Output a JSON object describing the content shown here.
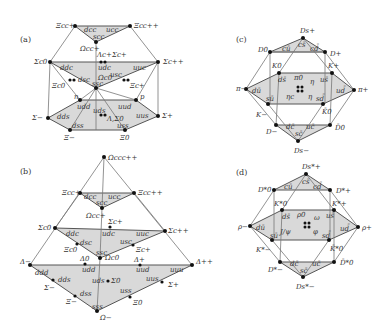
{
  "panels": {
    "a": {
      "label": "(a)",
      "top": {
        "left": "Ξcc+",
        "right": "Ξcc++",
        "q1": "dcc",
        "q2": "ucc",
        "q3": "scc",
        "center": "Ωcc+"
      },
      "middle": {
        "left": "Σc0",
        "right": "Σc++",
        "q_ddc": "ddc",
        "q_udc": "udc",
        "q_uuc": "uuc",
        "q_dsc": "dsc",
        "q_usc": "usc",
        "q_ssc": "ssc",
        "lam": "Λc+",
        "sig": "Σc+",
        "xi0": "Ξc0",
        "xiP": "Ξc+",
        "omega": "Ωc0"
      },
      "bottom": {
        "n": "n",
        "p": "p",
        "sm": "Σ−",
        "sp": "Σ+",
        "xm": "Ξ−",
        "x0": "Ξ0",
        "q_udd": "udd",
        "q_uud": "uud",
        "q_dds": "dds",
        "q_uds": "uds",
        "q_uus": "uus",
        "q_dss": "dss",
        "q_uss": "uss",
        "ls": "Λ,Σ0"
      }
    },
    "b": {
      "label": "(b)",
      "apex": "Ωccc++",
      "top": {
        "left": "Ξcc+",
        "right": "Ξcc++",
        "q1": "dcc",
        "q2": "ucc",
        "q3": "scc",
        "center": "Ωcc+"
      },
      "middle": {
        "left": "Σc0",
        "right": "Σc++",
        "sig": "Σc+",
        "q_ddc": "ddc",
        "q_udc": "udc",
        "q_uuc": "uuc",
        "q_dsc": "dsc",
        "q_usc": "usc",
        "q_ssc": "ssc",
        "xi0": "Ξc0",
        "xiP": "Ξc+",
        "omega": "Ωc0"
      },
      "bottom": {
        "dm": "Δ−",
        "d0": "Δ0",
        "dp": "Δ+",
        "dpp": "Δ++",
        "q_ddd": "ddd",
        "q_udd": "udd",
        "q_uud": "uud",
        "q_uuu": "uuu",
        "q_dds": "dds",
        "q_uds": "uds",
        "q_uus": "uus",
        "q_dss": "dss",
        "q_uss": "uss",
        "q_sss": "sss",
        "sm": "Σ−",
        "s0": "Σ0",
        "sp": "Σ+",
        "xm": "Ξ−",
        "x0": "Ξ0",
        "om": "Ω−"
      }
    },
    "c": {
      "label": "(c)",
      "top": {
        "apex": "Ds+",
        "left": "D0",
        "right": "D+",
        "q_cs": "cs̄",
        "q_cu": "cū",
        "q_cd": "cd̄"
      },
      "middle": {
        "k0": "K0",
        "kp": "K+",
        "pim": "π−",
        "pip": "π+",
        "km": "K−",
        "k0b": "K̄0",
        "q_ds": "ds̄",
        "q_us": "us̄",
        "q_du": "dū",
        "q_ud": "ud̄",
        "q_su": "sū",
        "q_sd": "sd̄",
        "pi0": "π0",
        "eta": "η",
        "etac": "ηc",
        "eta2": "η"
      },
      "bottom": {
        "dm": "D−",
        "d0b": "D̄0",
        "dsm": "Ds−",
        "q_dc": "dc̄",
        "q_uc": "uc̄",
        "q_sc": "sc̄"
      }
    },
    "d": {
      "label": "(d)",
      "top": {
        "apex": "Ds*+",
        "left": "D*0",
        "right": "D*+",
        "q_cs": "cs̄",
        "q_cu": "cū",
        "q_cd": "cd̄"
      },
      "middle": {
        "k0": "K*0",
        "kp": "K*+",
        "rhom": "ρ−",
        "rhop": "ρ+",
        "km": "K*−",
        "k0b": "K̄*0",
        "q_ds": "ds̄",
        "q_us": "us̄",
        "q_du": "dū",
        "q_ud": "ud̄",
        "q_su": "sū",
        "q_sd": "sd̄",
        "rho0": "ρ0",
        "omega": "ω",
        "jpsi": "J/ψ",
        "phi": "φ"
      },
      "bottom": {
        "dm": "D*−",
        "d0b": "D̄*0",
        "dsm": "Ds*−",
        "q_dc": "dc̄",
        "q_uc": "uc̄",
        "q_sc": "sc̄"
      }
    }
  },
  "colors": {
    "fill": "#d9d9d9",
    "line": "#555555",
    "dot": "#111111"
  }
}
